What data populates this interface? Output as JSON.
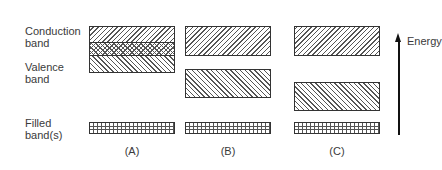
{
  "labels": {
    "conduction_line1": "Conduction",
    "conduction_line2": "band",
    "valence_line1": "Valence",
    "valence_line2": "band",
    "filled_line1": "Filled",
    "filled_line2": "band(s)"
  },
  "panels": [
    {
      "label": "(A)",
      "description": "Conduction and valence bands overlap (crosshatched overlap region)"
    },
    {
      "label": "(B)",
      "description": "Small band gap between conduction and valence bands"
    },
    {
      "label": "(C)",
      "description": "Large band gap between conduction and valence bands"
    }
  ],
  "axis": {
    "label": "Energy",
    "direction": "up"
  },
  "legend_patterns": {
    "conduction": "diagonal hatch (\\\\)",
    "valence": "diagonal hatch (//)",
    "overlap": "cross hatch",
    "filled": "grid"
  }
}
